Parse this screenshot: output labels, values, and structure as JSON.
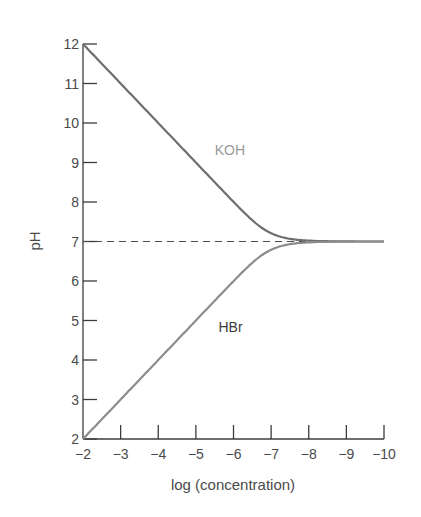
{
  "chart_data": {
    "type": "line",
    "title": "",
    "xlabel": "log (concentration)",
    "ylabel": "pH",
    "xlim": [
      -2,
      -10
    ],
    "ylim": [
      2,
      12
    ],
    "x_ticks": [
      -2,
      -3,
      -4,
      -5,
      -6,
      -7,
      -8,
      -9,
      -10
    ],
    "x_tick_labels": [
      "−2",
      "−3",
      "−4",
      "−5",
      "−6",
      "−7",
      "−8",
      "−9",
      "−10"
    ],
    "y_ticks": [
      2,
      3,
      4,
      5,
      6,
      7,
      8,
      9,
      10,
      11,
      12
    ],
    "y_tick_labels": [
      "2",
      "3",
      "4",
      "5",
      "6",
      "7",
      "8",
      "9",
      "10",
      "11",
      "12"
    ],
    "grid": false,
    "legend": "inline labels",
    "series": [
      {
        "name": "KOH",
        "x": [
          -2,
          -3,
          -4,
          -5,
          -6,
          -6.5,
          -7,
          -7.5,
          -8,
          -9,
          -10
        ],
        "values": [
          12.0,
          11.0,
          10.0,
          9.0,
          8.0,
          7.54,
          7.21,
          7.07,
          7.02,
          7.0,
          7.0
        ],
        "color": "#6e6e6e"
      },
      {
        "name": "HBr",
        "x": [
          -2,
          -3,
          -4,
          -5,
          -6,
          -6.5,
          -7,
          -7.5,
          -8,
          -9,
          -10
        ],
        "values": [
          2.0,
          3.0,
          4.0,
          5.0,
          6.0,
          6.46,
          6.79,
          6.93,
          6.98,
          7.0,
          7.0
        ],
        "color": "#8c8c8c"
      }
    ],
    "reference_lines": [
      {
        "name": "neutral",
        "y": 7,
        "style": "dashed",
        "color": "#4a4a4a"
      }
    ],
    "annotations": [
      {
        "text": "KOH",
        "x": -5.5,
        "y": 9.2
      },
      {
        "text": "HBr",
        "x": -5.6,
        "y": 4.7
      }
    ]
  },
  "colors": {
    "axis": "#3c3c3c",
    "koh_line": "#6e6e6e",
    "hbr_line": "#8c8c8c",
    "koh_label": "#9a9a9a",
    "hbr_label": "#3c3c3c"
  }
}
